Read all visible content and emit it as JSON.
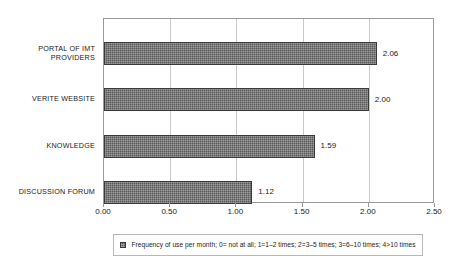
{
  "chart_data": {
    "type": "bar",
    "orientation": "horizontal",
    "title": "",
    "xlabel": "",
    "ylabel": "",
    "categories": [
      "PORTAL OF IMT\nPROVIDERS",
      "VERITE WEBSITE",
      "KNOWLEDGE",
      "DISCUSSION FORUM"
    ],
    "values": [
      2.06,
      2.0,
      1.59,
      1.12
    ],
    "data_labels": [
      "2.06",
      "2.00",
      "1.59",
      "1.12"
    ],
    "xlim": [
      0.0,
      2.5
    ],
    "xticks": [
      0.0,
      0.5,
      1.0,
      1.5,
      2.0,
      2.5
    ],
    "xticklabels": [
      "0.00",
      "0.50",
      "1.00",
      "1.50",
      "2.00",
      "2.50"
    ],
    "grid": "vertical",
    "legend_position": "bottom",
    "legend": [
      {
        "swatch_color": "#595959",
        "label": "Frequency of use per month; 0= not at all; 1=1–2 times; 2=3–5 times; 3=6–10 times; 4>10 times"
      }
    ],
    "series": [
      {
        "name": "Frequency of use per month; 0= not at all; 1=1–2 times; 2=3–5 times; 3=6–10 times; 4>10 times",
        "values": [
          2.06,
          2.0,
          1.59,
          1.12
        ],
        "color": "#595959"
      }
    ]
  },
  "colors": {
    "bar_fill": "#595959",
    "bar_edge": "#3a3a3a",
    "frame": "#9a9a9a",
    "gridline": "#c9c9c9",
    "text": "#1a1a1a",
    "background": "#ffffff"
  }
}
